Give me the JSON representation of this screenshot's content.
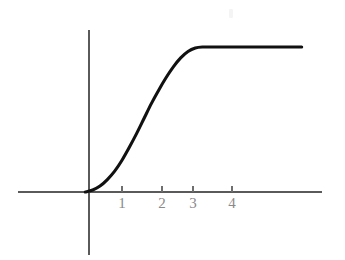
{
  "figure": {
    "background_color": "#ffffff",
    "axis_color": "#5a5a5a",
    "curve_color": "#111111",
    "tick_label_color": "#8a8a8a",
    "width": 345,
    "height": 260
  },
  "axes": {
    "x_axis_name": "x-axis",
    "y_axis_name": "y-axis",
    "x_axis_pixel_y": 192,
    "y_axis_pixel_x": 89,
    "x_axis_start_px": 18,
    "x_axis_end_px": 322,
    "y_axis_top_px": 30,
    "y_axis_bottom_px": 255
  },
  "ticks": [
    {
      "label": "1",
      "pixel_x": 122,
      "value": 1
    },
    {
      "label": "2",
      "pixel_x": 162,
      "value": 2
    },
    {
      "label": "3",
      "pixel_x": 193,
      "value": 3
    },
    {
      "label": "4",
      "pixel_x": 232,
      "value": 4
    }
  ],
  "chart_data": {
    "type": "line",
    "title": "",
    "subtitle": "",
    "xlabel": "",
    "ylabel": "",
    "grid": false,
    "legend": null,
    "xlim": [
      -1.8,
      6.0
    ],
    "ylim": [
      0,
      4.0
    ],
    "xticks": [
      1,
      2,
      3,
      4
    ],
    "xticklabels": [
      "1",
      "2",
      "3",
      "4"
    ],
    "yticks": [],
    "yticklabels": [],
    "series": [
      {
        "name": "saturating growth curve",
        "shape": "sigmoid",
        "x": [
          0.0,
          0.2,
          0.4,
          0.6,
          0.8,
          1.0,
          1.2,
          1.4,
          1.6,
          1.8,
          2.0,
          2.2,
          2.4,
          2.6,
          2.8,
          3.0,
          3.2,
          3.5,
          4.0,
          4.5,
          5.0,
          5.5,
          5.9
        ],
        "y": [
          0.0,
          0.04,
          0.12,
          0.25,
          0.42,
          0.64,
          0.9,
          1.18,
          1.48,
          1.78,
          2.05,
          2.3,
          2.52,
          2.7,
          2.83,
          2.9,
          2.92,
          2.92,
          2.92,
          2.92,
          2.92,
          2.92,
          2.92
        ]
      }
    ],
    "annotations": []
  },
  "artifact": {
    "name": "scan-speck",
    "pixel_x": 229,
    "pixel_y": 9,
    "width": 4,
    "height": 9
  }
}
